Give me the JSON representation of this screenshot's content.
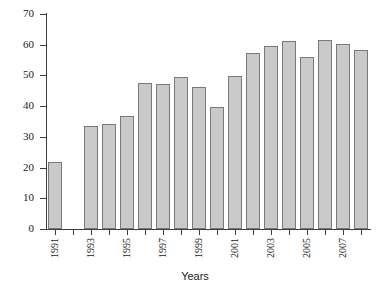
{
  "chart_data": {
    "type": "bar",
    "title": "",
    "subtitle": "",
    "xlabel": "Years",
    "ylabel": "",
    "categories": [
      "1991",
      "1992",
      "1993",
      "1994",
      "1995",
      "1996",
      "1997",
      "1998",
      "1999",
      "2000",
      "2001",
      "2002",
      "2003",
      "2004",
      "2005",
      "2006",
      "2007",
      "2008"
    ],
    "values": [
      21.8,
      null,
      33.6,
      34.2,
      36.8,
      47.6,
      47.2,
      49.5,
      46.2,
      39.6,
      49.8,
      57.3,
      59.6,
      61.3,
      56.1,
      61.6,
      60.3,
      58.4
    ],
    "ylim": [
      0,
      70
    ],
    "yticks": [
      0,
      10,
      20,
      30,
      40,
      50,
      60,
      70
    ],
    "ytick_labels": [
      "0",
      "10",
      "20",
      "30",
      "40",
      "50",
      "60",
      "70"
    ],
    "xtick_labels_shown": [
      "1991",
      "1993",
      "1995",
      "1997",
      "1999",
      "2001",
      "2003",
      "2005",
      "2007"
    ],
    "grid": false,
    "legend": false,
    "legend_position": "none",
    "bar_fill_color": "#c9c9c9",
    "bar_edge_color": "#7a7a7a",
    "axis_color": "#3c3c3c",
    "background_color": "#ffffff"
  },
  "axis": {
    "x_title": "Years"
  }
}
